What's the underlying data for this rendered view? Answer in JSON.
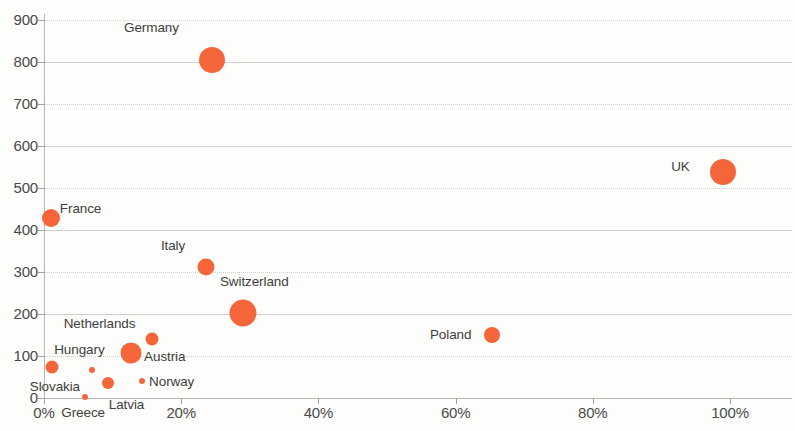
{
  "chart_data": {
    "type": "scatter",
    "title": "",
    "subtitle": "",
    "xlabel": "",
    "ylabel": "",
    "xlim": [
      0,
      109
    ],
    "ylim": [
      0,
      900
    ],
    "x_tick_labels": [
      "0%",
      "20%",
      "40%",
      "60%",
      "80%",
      "100%"
    ],
    "x_ticks": [
      0,
      20,
      40,
      60,
      80,
      100
    ],
    "y_tick_labels": [
      "0",
      "100",
      "200",
      "300",
      "400",
      "500",
      "600",
      "700",
      "800",
      "900"
    ],
    "y_ticks": [
      0,
      100,
      200,
      300,
      400,
      500,
      600,
      700,
      800,
      900
    ],
    "grid": true,
    "legend": "none",
    "bubble_color": "#f4663a",
    "points": [
      {
        "label": "Germany",
        "x": 24.5,
        "y": 805,
        "size": 26,
        "label_dx": -88,
        "label_dy": -32,
        "anchor": "start"
      },
      {
        "label": "UK",
        "x": 99.0,
        "y": 538,
        "size": 26,
        "label_dx": -52,
        "label_dy": -5,
        "anchor": "start"
      },
      {
        "label": "France",
        "x": 1.0,
        "y": 428,
        "size": 18,
        "label_dx": 9,
        "label_dy": -9,
        "anchor": "start"
      },
      {
        "label": "Italy",
        "x": 23.6,
        "y": 312,
        "size": 17,
        "label_dx": -45,
        "label_dy": -21,
        "anchor": "start"
      },
      {
        "label": "Switzerland",
        "x": 29.0,
        "y": 202,
        "size": 27,
        "label_dx": -23,
        "label_dy": -31,
        "anchor": "start"
      },
      {
        "label": "Poland",
        "x": 65.3,
        "y": 150,
        "size": 16,
        "label_dx": -62,
        "label_dy": 0,
        "anchor": "start"
      },
      {
        "label": "Netherlands",
        "x": 15.7,
        "y": 140,
        "size": 13,
        "label_dx": -88,
        "label_dy": -15,
        "anchor": "start"
      },
      {
        "label": "Austria",
        "x": 12.7,
        "y": 107,
        "size": 21,
        "label_dx": 13,
        "label_dy": 4,
        "anchor": "start"
      },
      {
        "label": "Hungary",
        "x": 1.2,
        "y": 74,
        "size": 13,
        "label_dx": 2,
        "label_dy": -17,
        "anchor": "start"
      },
      {
        "label": "Slovakia",
        "x": 7.0,
        "y": 66,
        "size": 6,
        "label_dx": -12,
        "label_dy": 17,
        "anchor": "end"
      },
      {
        "label": "Latvia",
        "x": 9.3,
        "y": 36,
        "size": 12,
        "label_dx": 1,
        "label_dy": 22,
        "anchor": "start"
      },
      {
        "label": "Norway",
        "x": 14.3,
        "y": 40,
        "size": 6,
        "label_dx": 7,
        "label_dy": 1,
        "anchor": "start"
      },
      {
        "label": "Greece",
        "x": 6.0,
        "y": 2,
        "size": 6,
        "label_dx": -2,
        "label_dy": 16,
        "anchor": "mid"
      }
    ]
  }
}
